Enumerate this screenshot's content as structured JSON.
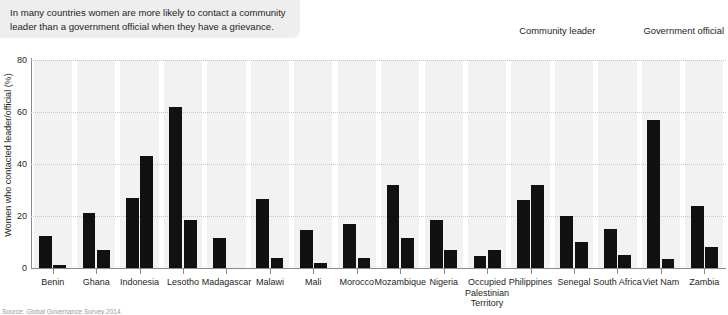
{
  "caption": {
    "text": "In many countries women are more likely to contact a community leader than a government official when they have a grievance."
  },
  "legend": {
    "position": "top-right",
    "items": [
      {
        "label": "Community leader",
        "color": "#111111",
        "swatch_icon": "square-swatch-icon"
      },
      {
        "label": "Government official",
        "color": "#111111",
        "swatch_icon": "square-swatch-icon"
      }
    ]
  },
  "source": {
    "text": "Source: Global Governance Survey 2014"
  },
  "chart_data": {
    "type": "bar",
    "title": "",
    "xlabel": "",
    "ylabel": "Women who contacted leader/official (%)",
    "ylim": [
      0,
      80
    ],
    "yticks": [
      0,
      20,
      40,
      60,
      80
    ],
    "grid": true,
    "legend_position": "top-right",
    "categories": [
      "Benin",
      "Ghana",
      "Indonesia",
      "Lesotho",
      "Madagascar",
      "Malawi",
      "Mali",
      "Morocco",
      "Mozambique",
      "Nigeria",
      "Occupied Palestinian Territory",
      "Philippines",
      "Senegal",
      "South Africa",
      "Viet Nam",
      "Zambia"
    ],
    "series": [
      {
        "name": "Community leader",
        "color": "#111111",
        "values": [
          12.3,
          21.0,
          27.0,
          62.0,
          11.5,
          26.5,
          14.5,
          17.0,
          32.0,
          18.5,
          4.5,
          26.0,
          20.0,
          15.0,
          57.0,
          24.0
        ]
      },
      {
        "name": "Government official",
        "color": "#111111",
        "values": [
          1.0,
          7.0,
          43.0,
          18.5,
          0.0,
          4.0,
          2.0,
          4.0,
          11.5,
          7.0,
          7.0,
          32.0,
          10.0,
          5.0,
          3.5,
          8.0
        ]
      }
    ]
  }
}
